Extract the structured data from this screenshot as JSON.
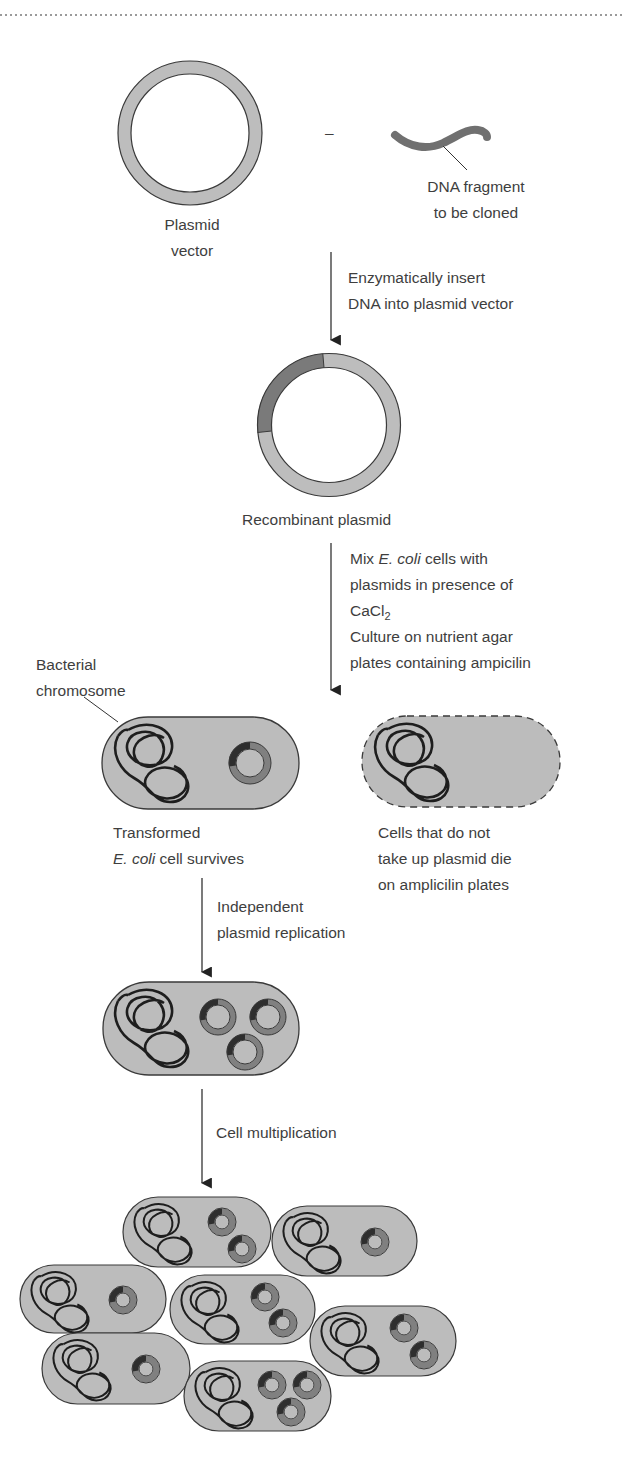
{
  "figure": {
    "colors": {
      "ring_light": "#bdbdbd",
      "ring_insert": "#7a7a7a",
      "plasmid_ring_in_cell": "#808080",
      "plasmid_insert_in_cell": "#2e2e2e",
      "cell_fill": "#bcbcbc",
      "outline": "#3a3a3a",
      "chromosome": "#1e1e1e",
      "dna_fragment": "#707070",
      "text": "#3e3e3e",
      "dotted_rule": "#9a9a9a"
    }
  },
  "labels": {
    "plasmid_vector": [
      "Plasmid",
      "vector"
    ],
    "operator": "–",
    "dna_fragment": [
      "DNA fragment",
      "to be cloned"
    ],
    "step1": [
      "Enzymatically insert",
      "DNA into plasmid vector"
    ],
    "recombinant_plasmid": "Recombinant plasmid",
    "step2": {
      "line1_pre": "Mix ",
      "line1_ital": "E. coli",
      "line1_post": " cells with",
      "line2": "plasmids in presence of",
      "line3_base": "CaCl",
      "line3_sub": "2",
      "line4": "Culture on nutrient agar",
      "line5": "plates containing ampicilin"
    },
    "bacterial_chromosome": [
      "Bacterial",
      "chromosome"
    ],
    "transformed": {
      "line1": "Transformed",
      "line2_ital": "E. coli",
      "line2_post": " cell survives"
    },
    "untransformed": [
      "Cells that do not",
      "take up plasmid die",
      "on amplicilin plates"
    ],
    "step3": [
      "Independent",
      "plasmid replication"
    ],
    "step4": "Cell multiplication"
  },
  "cells": {
    "transformed": {
      "x": 102,
      "y": 717,
      "w": 197,
      "h": 92,
      "plasmids": [
        [
          250,
          763,
          21
        ]
      ]
    },
    "untransformed": {
      "x": 362,
      "y": 716,
      "w": 198,
      "h": 91,
      "dashed": true
    },
    "replicated": {
      "x": 103,
      "y": 982,
      "w": 196,
      "h": 93,
      "plasmids": [
        [
          218,
          1017,
          18
        ],
        [
          268,
          1017,
          18
        ],
        [
          245,
          1052,
          18
        ]
      ]
    },
    "colony": [
      {
        "x": 123,
        "y": 1197,
        "w": 148,
        "h": 70,
        "plasmids": [
          [
            222,
            1222,
            14
          ],
          [
            242,
            1249,
            14
          ]
        ]
      },
      {
        "x": 272,
        "y": 1206,
        "w": 145,
        "h": 70,
        "plasmids": [
          [
            375,
            1242,
            14
          ]
        ]
      },
      {
        "x": 20,
        "y": 1265,
        "w": 146,
        "h": 68,
        "plasmids": [
          [
            123,
            1300,
            14
          ]
        ]
      },
      {
        "x": 170,
        "y": 1275,
        "w": 145,
        "h": 69,
        "plasmids": [
          [
            265,
            1297,
            14
          ],
          [
            283,
            1323,
            14
          ]
        ]
      },
      {
        "x": 310,
        "y": 1306,
        "w": 146,
        "h": 70,
        "plasmids": [
          [
            404,
            1328,
            14
          ],
          [
            424,
            1355,
            14
          ]
        ]
      },
      {
        "x": 42,
        "y": 1333,
        "w": 148,
        "h": 71,
        "plasmids": [
          [
            146,
            1369,
            14
          ]
        ]
      },
      {
        "x": 184,
        "y": 1361,
        "w": 147,
        "h": 70,
        "plasmids": [
          [
            272,
            1385,
            14
          ],
          [
            307,
            1385,
            14
          ],
          [
            291,
            1412,
            14
          ]
        ]
      }
    ]
  }
}
